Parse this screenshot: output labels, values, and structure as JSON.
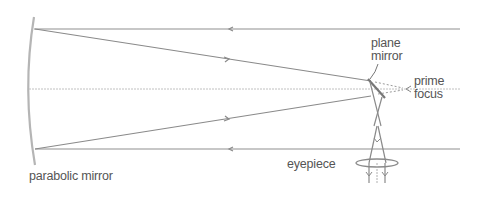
{
  "diagram": {
    "labels": {
      "parabolic_mirror": "parabolic mirror",
      "plane_mirror_line1": "plane",
      "plane_mirror_line2": "mirror",
      "prime_focus_line1": "prime",
      "prime_focus_line2": "focus",
      "eyepiece": "eyepiece"
    },
    "colors": {
      "line": "#8a8a8a",
      "axis": "#b8b8b8",
      "mirror": "#b0b0b0",
      "text": "#555555"
    }
  }
}
